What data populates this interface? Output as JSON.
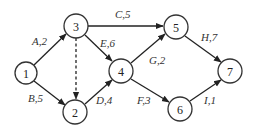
{
  "diagram": {
    "type": "directed-activity-network",
    "colors": {
      "stroke": "#222222",
      "node_fill": "#ffffff",
      "text": "#222222"
    },
    "nodes": [
      {
        "id": "1",
        "label": "1",
        "x": 26,
        "y": 73,
        "r": 11
      },
      {
        "id": "2",
        "label": "2",
        "x": 75,
        "y": 112,
        "r": 12
      },
      {
        "id": "3",
        "label": "3",
        "x": 76,
        "y": 26,
        "r": 12
      },
      {
        "id": "4",
        "label": "4",
        "x": 121,
        "y": 71,
        "r": 12
      },
      {
        "id": "5",
        "label": "5",
        "x": 176,
        "y": 27,
        "r": 12
      },
      {
        "id": "6",
        "label": "6",
        "x": 180,
        "y": 109,
        "r": 12
      },
      {
        "id": "7",
        "label": "7",
        "x": 230,
        "y": 71,
        "r": 12
      }
    ],
    "edges": [
      {
        "from": "1",
        "to": "3",
        "activity": "A",
        "duration": 2,
        "label": "A,2",
        "dashed": false
      },
      {
        "from": "1",
        "to": "2",
        "activity": "B",
        "duration": 5,
        "label": "B,5",
        "dashed": false
      },
      {
        "from": "3",
        "to": "5",
        "activity": "C",
        "duration": 5,
        "label": "C,5",
        "dashed": false
      },
      {
        "from": "3",
        "to": "4",
        "activity": "E",
        "duration": 6,
        "label": "E,6",
        "dashed": false
      },
      {
        "from": "3",
        "to": "2",
        "activity": "",
        "duration": 0,
        "label": "",
        "dashed": true
      },
      {
        "from": "2",
        "to": "4",
        "activity": "D",
        "duration": 4,
        "label": "D,4",
        "dashed": false
      },
      {
        "from": "4",
        "to": "5",
        "activity": "G",
        "duration": 2,
        "label": "G,2",
        "dashed": false
      },
      {
        "from": "4",
        "to": "6",
        "activity": "F",
        "duration": 3,
        "label": "F,3",
        "dashed": false
      },
      {
        "from": "5",
        "to": "7",
        "activity": "H",
        "duration": 7,
        "label": "H,7",
        "dashed": false
      },
      {
        "from": "6",
        "to": "7",
        "activity": "I",
        "duration": 1,
        "label": "I,1",
        "dashed": false
      }
    ]
  }
}
